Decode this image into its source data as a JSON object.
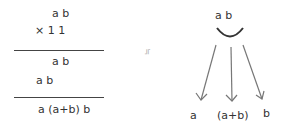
{
  "left": {
    "row1": "a b",
    "row2": "× 1 1",
    "row3": "a b",
    "row4": "a b",
    "result": "a (a+b) b"
  },
  "middle": {
    "symbol": "≒"
  },
  "right": {
    "top": "a b",
    "labels": [
      "a",
      "(a+b)",
      "b"
    ]
  }
}
